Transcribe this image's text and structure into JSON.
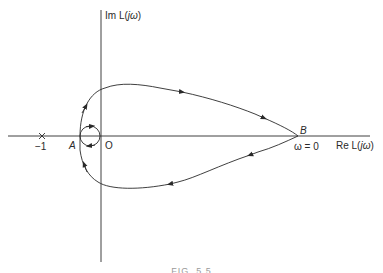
{
  "diagram": {
    "type": "Nyquist plot",
    "axes": {
      "imag_label_prefix": "Im L(",
      "imag_label_var": "jω",
      "imag_label_suffix": ")",
      "real_label_prefix": "Re L(",
      "real_label_var": "jω",
      "real_label_suffix": ")"
    },
    "points": {
      "critical": {
        "marker": "×",
        "label": "−1"
      },
      "A": {
        "label": "A"
      },
      "O": {
        "label": "O"
      },
      "B": {
        "label": "B",
        "annotation": "ω = 0"
      }
    },
    "caption": "FIG. 5.5",
    "colors": {
      "stroke": "#2a2a2a",
      "background": "#ffffff"
    }
  }
}
